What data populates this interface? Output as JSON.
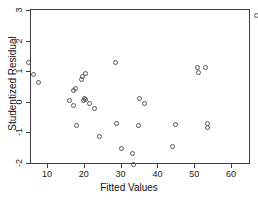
{
  "chart_data": {
    "type": "scatter",
    "title": "",
    "xlabel": "Fitted Values",
    "ylabel": "Studentized Residual",
    "xlim": [
      3,
      68
    ],
    "ylim": [
      -2.2,
      3.05
    ],
    "xticks": [
      10,
      20,
      30,
      40,
      50,
      60
    ],
    "yticks": [
      -2,
      -1,
      0,
      1,
      2,
      3
    ],
    "grid": false,
    "legend": null,
    "marker": "open-circle",
    "points": [
      {
        "x": 5.0,
        "y": 1.3
      },
      {
        "x": 6.4,
        "y": 0.9
      },
      {
        "x": 7.7,
        "y": 0.62
      },
      {
        "x": 16.1,
        "y": 0.04
      },
      {
        "x": 17.2,
        "y": -0.12
      },
      {
        "x": 17.3,
        "y": 0.38
      },
      {
        "x": 17.7,
        "y": 0.45
      },
      {
        "x": 18.1,
        "y": -0.77
      },
      {
        "x": 19.4,
        "y": 0.73
      },
      {
        "x": 19.6,
        "y": 0.82
      },
      {
        "x": 20.0,
        "y": 0.05
      },
      {
        "x": 20.2,
        "y": 0.1
      },
      {
        "x": 20.4,
        "y": 0.08
      },
      {
        "x": 20.5,
        "y": 0.92
      },
      {
        "x": 21.6,
        "y": -0.04
      },
      {
        "x": 23.0,
        "y": -0.23
      },
      {
        "x": 24.2,
        "y": -1.15
      },
      {
        "x": 28.6,
        "y": 1.29
      },
      {
        "x": 28.8,
        "y": -0.72
      },
      {
        "x": 30.2,
        "y": -1.53
      },
      {
        "x": 33.1,
        "y": -1.68
      },
      {
        "x": 33.5,
        "y": -2.05
      },
      {
        "x": 34.8,
        "y": -0.79
      },
      {
        "x": 35.2,
        "y": 0.12
      },
      {
        "x": 36.6,
        "y": -0.05
      },
      {
        "x": 44.1,
        "y": -1.46
      },
      {
        "x": 45.0,
        "y": -0.74
      },
      {
        "x": 50.8,
        "y": 1.13
      },
      {
        "x": 51.2,
        "y": 0.95
      },
      {
        "x": 53.2,
        "y": 1.12
      },
      {
        "x": 53.6,
        "y": -0.7
      },
      {
        "x": 53.7,
        "y": -0.85
      },
      {
        "x": 67.0,
        "y": 2.83
      }
    ]
  },
  "axes": {
    "x_tick_labels": [
      "10",
      "20",
      "30",
      "40",
      "50",
      "60"
    ],
    "y_tick_labels": [
      "3",
      "2",
      "1",
      "0",
      "-1",
      "-2"
    ],
    "x_title": "Fitted Values",
    "y_title": "Studentized Residual"
  },
  "style": {
    "frame_color": "#3c3c3c",
    "marker_color": "#555555",
    "background": "#ffffff",
    "text_color": "#1a1a1a"
  }
}
